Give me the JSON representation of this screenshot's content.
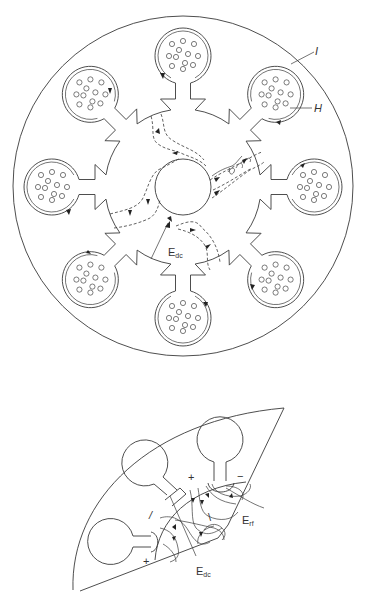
{
  "figure_top": {
    "title": "Circular electrode array with central hub (top view)",
    "labels": {
      "I": "I",
      "H": "H",
      "E_main": "E",
      "E_sub": "dc"
    },
    "pad_count": 8,
    "center": [
      183,
      187
    ],
    "outer_radius": 170,
    "hub_radius": 78,
    "hole_radius": 28,
    "pad_radius": 28,
    "pad_distance": 131
  },
  "figure_bottom": {
    "title": "Sector detail with field lines",
    "labels": {
      "plus_top": "+",
      "minus": "−",
      "slash": "/",
      "slash2": "\\",
      "plus_bottom": "+",
      "Erf_main": "E",
      "Erf_sub": "rf",
      "Edc_main": "E",
      "Edc_sub": "dc"
    }
  },
  "colors": {
    "line": "#3a3a3a",
    "background": "#ffffff"
  }
}
